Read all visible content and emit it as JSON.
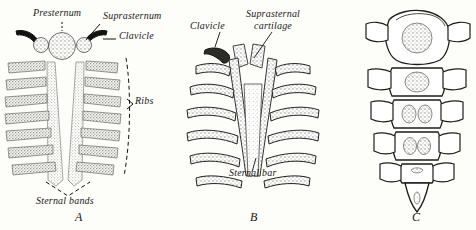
{
  "figure": {
    "background_color": "#fdfdfa",
    "ink_color": "#1a1a1a",
    "stipple_color": "#9a9a95",
    "panels": [
      {
        "id": "A",
        "caption": "A",
        "description": "Paired sternal bands with presternum, suprasternal nodules, clavicles and ribs",
        "labels": [
          {
            "name": "presternum",
            "text": "Presternum",
            "leader": "dashed-vertical"
          },
          {
            "name": "suprasternum",
            "text": "Suprasternum",
            "leader": "curved"
          },
          {
            "name": "clavicle",
            "text": "Clavicle",
            "leader": "straight-dash"
          },
          {
            "name": "ribs",
            "text": "Ribs",
            "leader": "brace"
          },
          {
            "name": "sternal-bands",
            "text": "Sternal bands",
            "leader": "dashed-v"
          }
        ]
      },
      {
        "id": "B",
        "caption": "B",
        "description": "Fusing sternal bars with suprasternal cartilage and clavicle",
        "labels": [
          {
            "name": "clavicle",
            "text": "Clavicle",
            "leader": "straight"
          },
          {
            "name": "suprasternal-cartilage",
            "text": "Suprasternal\ncartilage",
            "line1": "Suprasternal",
            "line2": "cartilage",
            "leader": "straight"
          },
          {
            "name": "sternal-bar",
            "text": "Sternal bar",
            "leader": "straight"
          }
        ]
      },
      {
        "id": "C",
        "caption": "C",
        "description": "Segmented sternum with manubrium, body segments, ossification centers and xiphoid process",
        "labels": []
      }
    ]
  },
  "labels": {
    "presternum": "Presternum",
    "suprasternum": "Suprasternum",
    "clavicle_a": "Clavicle",
    "ribs": "Ribs",
    "sternal_bands": "Sternal bands",
    "clavicle_b": "Clavicle",
    "suprasternal_line1": "Suprasternal",
    "suprasternal_line2": "cartilage",
    "sternal_bar": "Sternal bar"
  },
  "captions": {
    "a": "A",
    "b": "B",
    "c": "C"
  }
}
